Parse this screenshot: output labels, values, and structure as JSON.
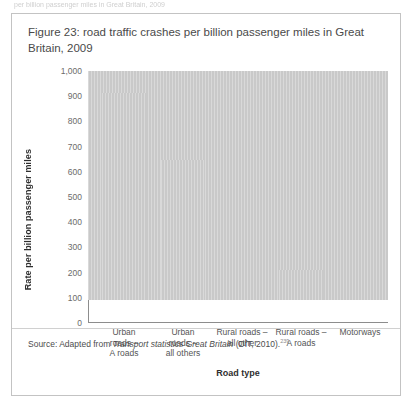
{
  "page": {
    "top_fragment": "per billion passenger miles in Great Britain, 2009"
  },
  "figure": {
    "title": "Figure 23: road traffic crashes per billion passenger miles in Great Britain, 2009",
    "source_prefix": "Source: Adapted from ",
    "source_italic": "Transport statistics Great Britain",
    "source_suffix": " (DfT, 2010).",
    "source_superscript": "239"
  },
  "chart_data": {
    "type": "bar",
    "title": "Figure 23: road traffic crashes per billion passenger miles in Great Britain, 2009",
    "xlabel": "Road type",
    "ylabel": "Rate per billion passenger miles",
    "ylim": [
      0,
      1000
    ],
    "ytick_labels": [
      "1,000",
      "900",
      "800",
      "700",
      "600",
      "500",
      "400",
      "300",
      "200",
      "100",
      "0"
    ],
    "ytick_values": [
      1000,
      900,
      800,
      700,
      600,
      500,
      400,
      300,
      200,
      100,
      0
    ],
    "grid": false,
    "legend": "none",
    "bar_color": "#c9c9c9",
    "categories": [
      "Urban\nroads –\nA roads",
      "Urban\nroads –\nall others",
      "Rural roads –\nall other",
      "Rural roads –\nA roads",
      "Motorways"
    ],
    "values": [
      908,
      820,
      555,
      335,
      120
    ]
  }
}
